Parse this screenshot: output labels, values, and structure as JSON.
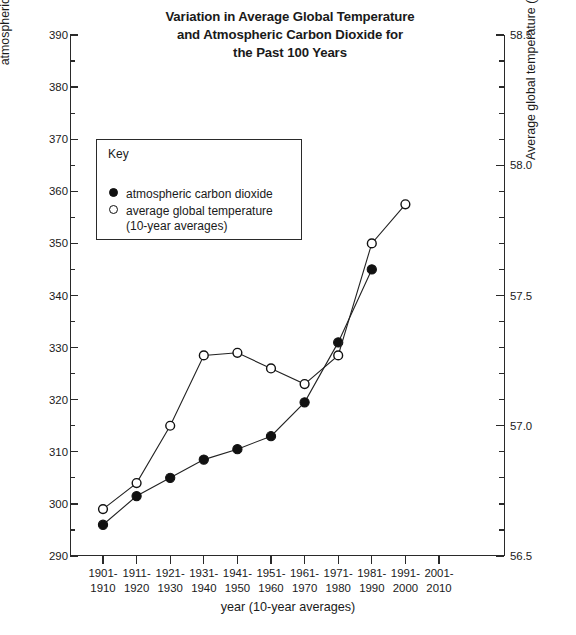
{
  "title": "Variation in Average Global Temperature\nand Atmospheric Carbon Dioxide for\nthe Past 100 Years",
  "legend": {
    "heading": "Key",
    "entries": [
      {
        "marker": "filled-circle",
        "label": "atmospheric carbon dioxide"
      },
      {
        "marker": "open-circle",
        "label": "average global temperature\n(10-year averages)"
      }
    ]
  },
  "axes": {
    "left_title": "atmospheric carbon dioxide (parts per million)",
    "right_title": "Average global temperature (°C)",
    "bottom_title": "year (10-year averages)"
  },
  "chart_data": {
    "type": "line",
    "title": "Variation in Average Global Temperature and Atmospheric Carbon Dioxide for the Past 100 Years",
    "xlabel": "year (10-year averages)",
    "ylabel": "atmospheric carbon dioxide (parts per million)",
    "y2label": "Average global temperature (°C)",
    "categories": [
      "1901-\n1910",
      "1911-\n1920",
      "1921-\n1930",
      "1931-\n1940",
      "1941-\n1950",
      "1951-\n1960",
      "1961-\n1970",
      "1971-\n1980",
      "1981-\n1990",
      "1991-\n2000",
      "2001-\n2010"
    ],
    "ylim": [
      290,
      390
    ],
    "yticks": [
      290,
      300,
      310,
      320,
      330,
      340,
      350,
      360,
      370,
      380,
      390
    ],
    "ytick_labels": [
      "290",
      "300",
      "310",
      "320",
      "330",
      "340",
      "350",
      "360",
      "370",
      "380",
      "390"
    ],
    "y_minor_step": 5,
    "y2lim": [
      56.5,
      58.5
    ],
    "y2ticks": [
      56.5,
      57.0,
      57.5,
      58.0,
      58.5
    ],
    "y2tick_labels": [
      "56.5",
      "57.0",
      "57.5",
      "58.0",
      "58.5"
    ],
    "y2_minor_step": 0.1,
    "grid": false,
    "legend_position": "upper-left-inset",
    "series": [
      {
        "name": "atmospheric carbon dioxide",
        "axis": "left",
        "marker": "filled-circle",
        "units": "parts per million",
        "values": [
          296,
          301.5,
          305,
          308.5,
          310.5,
          313,
          319.5,
          331,
          345,
          null,
          null
        ]
      },
      {
        "name": "average global temperature (10-year averages)",
        "axis": "right",
        "marker": "open-circle",
        "units": "°C",
        "values": [
          56.68,
          56.78,
          57.0,
          57.27,
          57.28,
          57.22,
          57.16,
          57.27,
          57.7,
          57.85,
          null
        ]
      }
    ]
  }
}
